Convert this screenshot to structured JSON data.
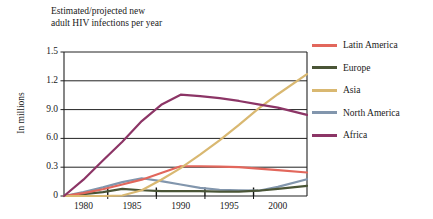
{
  "chart_data": {
    "type": "line",
    "title": "Estimated/projected new\nadult HIV infections per year",
    "xlabel": "",
    "ylabel": "In millions",
    "grid": true,
    "legend_position": "right",
    "xlim": [
      1978,
      2003
    ],
    "ylim": [
      0,
      1.5
    ],
    "x_tick_labels": [
      "1980",
      "1985",
      "1990",
      "1995",
      "2000"
    ],
    "x_ticks": [
      1980,
      1985,
      1990,
      1995,
      2000
    ],
    "y_tick_labels": [
      "1.5",
      "1.2",
      "9.0",
      "6.0",
      "0.3",
      "0"
    ],
    "y_ticks": [
      1.5,
      1.2,
      0.9,
      0.6,
      0.3,
      0
    ],
    "x": [
      1978,
      1980,
      1982,
      1984,
      1986,
      1988,
      1990,
      1992,
      1994,
      1996,
      1998,
      2000,
      2003
    ],
    "series": [
      {
        "name": "Latin America",
        "color": "#e2675c",
        "values": [
          0.0,
          0.03,
          0.07,
          0.12,
          0.17,
          0.24,
          0.31,
          0.31,
          0.305,
          0.3,
          0.285,
          0.27,
          0.245
        ]
      },
      {
        "name": "Europe",
        "color": "#4a5536",
        "values": [
          0.0,
          0.02,
          0.04,
          0.075,
          0.06,
          0.05,
          0.05,
          0.05,
          0.045,
          0.045,
          0.055,
          0.075,
          0.105
        ]
      },
      {
        "name": "Asia",
        "color": "#d9b871",
        "values": [
          0.0,
          0.0,
          0.0,
          0.005,
          0.06,
          0.17,
          0.29,
          0.43,
          0.58,
          0.74,
          0.91,
          1.06,
          1.27
        ]
      },
      {
        "name": "North America",
        "color": "#8296ad",
        "values": [
          0.0,
          0.04,
          0.09,
          0.145,
          0.185,
          0.155,
          0.12,
          0.085,
          0.065,
          0.06,
          0.055,
          0.095,
          0.175
        ]
      },
      {
        "name": "Africa",
        "color": "#8c3566",
        "values": [
          0.0,
          0.17,
          0.37,
          0.565,
          0.78,
          0.95,
          1.055,
          1.04,
          1.02,
          0.99,
          0.955,
          0.92,
          0.845
        ]
      }
    ]
  }
}
